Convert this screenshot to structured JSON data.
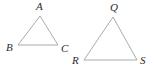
{
  "figure": {
    "name": "two-triangles-geometry-figure",
    "background_color": "#ffffff",
    "stroke_color": "#a0a0a0",
    "label_color": "#2b2b2b",
    "stroke_width": 0.9,
    "width": 154,
    "height": 75
  },
  "shapes": [
    {
      "name": "triangle-abc",
      "label": "Triangle ABC",
      "points": "40,16 18,45 58,45",
      "vertices": [
        {
          "id": "A",
          "label": "A",
          "x": 40,
          "y": 16,
          "label_x": 36,
          "label_y": 1
        },
        {
          "id": "B",
          "label": "B",
          "x": 18,
          "y": 45,
          "label_x": 6,
          "label_y": 42
        },
        {
          "id": "C",
          "label": "C",
          "x": 58,
          "y": 45,
          "label_x": 61,
          "label_y": 43
        }
      ]
    },
    {
      "name": "triangle-qrs",
      "label": "Triangle QRS",
      "points": "113,17 84,60 137,60",
      "vertices": [
        {
          "id": "Q",
          "label": "Q",
          "x": 113,
          "y": 17,
          "label_x": 110,
          "label_y": 2
        },
        {
          "id": "R",
          "label": "R",
          "x": 84,
          "y": 60,
          "label_x": 72,
          "label_y": 55
        },
        {
          "id": "S",
          "label": "S",
          "x": 137,
          "y": 60,
          "label_x": 140,
          "label_y": 55
        }
      ]
    }
  ]
}
